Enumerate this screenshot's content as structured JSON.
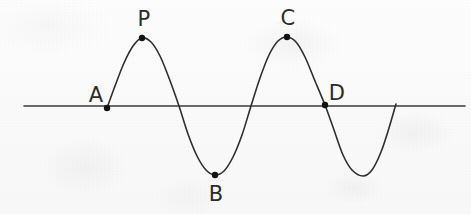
{
  "figure": {
    "width": 471,
    "height": 214,
    "background_color": "#fafafa",
    "ink_color": "#333333"
  },
  "chart_data": {
    "type": "line",
    "title": "",
    "xlabel": "",
    "ylabel": "",
    "xlim": [
      24,
      465
    ],
    "ylim": [
      176,
      37
    ],
    "grid": false,
    "legend": null,
    "axis_line": {
      "orientation": "horizontal",
      "y": 106,
      "x_start": 24,
      "x_end": 465,
      "color": "#3a3a3a",
      "width": 1.6
    },
    "curve": {
      "name": "sine wave",
      "color": "#2e2e2e",
      "width": 1.6,
      "amplitude": 69,
      "baseline_y": 106,
      "x_start": 107,
      "x_end": 396,
      "period": 144,
      "path_points": [
        [
          107,
          108
        ],
        [
          115,
          86
        ],
        [
          124,
          63
        ],
        [
          133,
          46
        ],
        [
          142,
          38
        ],
        [
          151,
          42
        ],
        [
          160,
          56
        ],
        [
          169,
          78
        ],
        [
          179,
          106
        ],
        [
          188,
          134
        ],
        [
          197,
          156
        ],
        [
          206,
          170
        ],
        [
          215,
          175
        ],
        [
          224,
          171
        ],
        [
          233,
          157
        ],
        [
          242,
          135
        ],
        [
          251,
          106
        ],
        [
          260,
          78
        ],
        [
          269,
          55
        ],
        [
          278,
          41
        ],
        [
          287,
          37
        ],
        [
          296,
          42
        ],
        [
          305,
          57
        ],
        [
          315,
          81
        ],
        [
          325,
          105
        ],
        [
          334,
          130
        ],
        [
          343,
          155
        ],
        [
          352,
          170
        ],
        [
          363,
          176
        ],
        [
          372,
          170
        ],
        [
          381,
          152
        ],
        [
          389,
          128
        ],
        [
          396,
          104
        ]
      ]
    },
    "points": [
      {
        "label": "A",
        "x": 107,
        "y": 108,
        "label_x": 96,
        "label_y": 95,
        "kind": "zero-crossing-rising"
      },
      {
        "label": "P",
        "x": 142,
        "y": 38,
        "label_x": 144,
        "label_y": 19,
        "kind": "maximum"
      },
      {
        "label": "B",
        "x": 215,
        "y": 175,
        "label_x": 216,
        "label_y": 194,
        "kind": "minimum"
      },
      {
        "label": "C",
        "x": 287,
        "y": 37,
        "label_x": 288,
        "label_y": 18,
        "kind": "maximum"
      },
      {
        "label": "D",
        "x": 325,
        "y": 105,
        "label_x": 337,
        "label_y": 93,
        "kind": "zero-crossing-falling"
      }
    ],
    "marker": {
      "shape": "circle",
      "radius": 3.2,
      "fill": "#121212"
    }
  }
}
